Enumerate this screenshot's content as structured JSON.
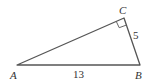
{
  "diagram": {
    "type": "right-triangle",
    "stroke_color": "#555555",
    "vertices": {
      "A": {
        "label": "A",
        "x": 17,
        "y": 65
      },
      "B": {
        "label": "B",
        "x": 140,
        "y": 65
      },
      "C": {
        "label": "C",
        "x": 124,
        "y": 18
      }
    },
    "right_angle_at": "C",
    "sides": {
      "AB": {
        "label": "13"
      },
      "BC": {
        "label": "5"
      }
    }
  }
}
